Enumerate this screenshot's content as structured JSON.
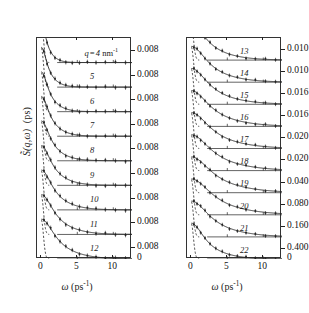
{
  "figure": {
    "y_axis_label_sym": "S",
    "y_axis_label_args": "(q,ω)",
    "y_axis_label_unit": "(ps)",
    "x_axis_label_sym": "ω",
    "x_axis_label_unit": "(ps",
    "x_axis_label_exp": "-1",
    "x_axis_label_close": ")",
    "line_color": "#222222",
    "frame_color": "#333333"
  },
  "chart_data": {
    "type": "line",
    "title": "",
    "xlabel": "ω (ps⁻¹)",
    "ylabel": "S̃ (q,ω) (ps)",
    "xlim": [
      -0.6,
      12.6
    ],
    "xticks": [
      0,
      5,
      10
    ],
    "xticklabels": [
      "0",
      "5",
      "10"
    ],
    "grid": false,
    "legend": "none",
    "panels": [
      {
        "name": "left-panel",
        "curves": [
          {
            "label": "q = 4 nm-1",
            "q": 4,
            "amplitude": 0.008,
            "width": 0.95,
            "baseline_tick": "0.008"
          },
          {
            "label": "5",
            "q": 5,
            "amplitude": 0.008,
            "width": 1.15,
            "baseline_tick": "0.008"
          },
          {
            "label": "6",
            "q": 6,
            "amplitude": 0.008,
            "width": 1.35,
            "baseline_tick": "0.008"
          },
          {
            "label": "7",
            "q": 7,
            "amplitude": 0.008,
            "width": 1.55,
            "baseline_tick": "0.008"
          },
          {
            "label": "8",
            "q": 8,
            "amplitude": 0.008,
            "width": 1.75,
            "baseline_tick": "0.008"
          },
          {
            "label": "9",
            "q": 9,
            "amplitude": 0.008,
            "width": 1.95,
            "baseline_tick": "0.008"
          },
          {
            "label": "10",
            "q": 10,
            "amplitude": 0.008,
            "width": 2.2,
            "baseline_tick": "0.008"
          },
          {
            "label": "11",
            "q": 11,
            "amplitude": 0.008,
            "width": 2.45,
            "baseline_tick": "0.008"
          },
          {
            "label": "12",
            "q": 12,
            "amplitude": 0.008,
            "width": 2.7,
            "baseline_tick": "0.008"
          }
        ],
        "zero_tick": "0",
        "ytick_labels": [
          "0.008",
          "0.008",
          "0.008",
          "0.008",
          "0.008",
          "0.008",
          "0.008",
          "0.008",
          "0.008",
          "0"
        ]
      },
      {
        "name": "right-panel",
        "curves": [
          {
            "label": "13",
            "q": 13,
            "amplitude": 0.01,
            "width": 2.95,
            "baseline_tick": "0.010"
          },
          {
            "label": "14",
            "q": 14,
            "amplitude": 0.01,
            "width": 3.15,
            "baseline_tick": "0.010"
          },
          {
            "label": "15",
            "q": 15,
            "amplitude": 0.016,
            "width": 3.35,
            "baseline_tick": "0.016"
          },
          {
            "label": "16",
            "q": 16,
            "amplitude": 0.016,
            "width": 3.55,
            "baseline_tick": "0.016"
          },
          {
            "label": "17",
            "q": 17,
            "amplitude": 0.02,
            "width": 3.7,
            "baseline_tick": "0.020"
          },
          {
            "label": "18",
            "q": 18,
            "amplitude": 0.02,
            "width": 3.85,
            "baseline_tick": "0.020"
          },
          {
            "label": "19",
            "q": 19,
            "amplitude": 0.04,
            "width": 3.95,
            "baseline_tick": "0.040"
          },
          {
            "label": "20",
            "q": 20,
            "amplitude": 0.08,
            "width": 4.0,
            "baseline_tick": "0.080"
          },
          {
            "label": "21",
            "q": 21,
            "amplitude": 0.16,
            "width": 3.6,
            "baseline_tick": "0.160"
          },
          {
            "label": "22",
            "q": 22,
            "amplitude": 0.4,
            "width": 2.6,
            "baseline_tick": "0.400"
          }
        ],
        "zero_tick": "0",
        "ytick_labels": [
          "0.010",
          "0.010",
          "0.016",
          "0.016",
          "0.020",
          "0.020",
          "0.040",
          "0.080",
          "0.160",
          "0.400",
          "0"
        ]
      }
    ]
  }
}
